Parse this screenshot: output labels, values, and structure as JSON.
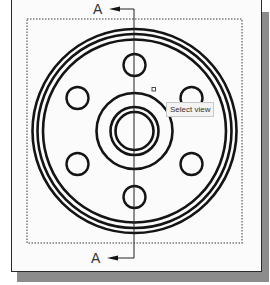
{
  "drawing": {
    "section_label_top": "A",
    "section_label_bottom": "A",
    "tooltip_text": "Select view",
    "colors": {
      "line": "#141414",
      "view_border": "#9a9a9a",
      "sheet": "#fbfbfb",
      "shadow": "#8c8c8c"
    },
    "center": {
      "x": 134.5,
      "y": 131
    },
    "outer_rings_radii": [
      102,
      97,
      92
    ],
    "hub_rings_radii": [
      38,
      24,
      19
    ],
    "bolt_circle_radius": 66,
    "bolt_hole_radius": 11,
    "bolt_hole_count": 6
  }
}
